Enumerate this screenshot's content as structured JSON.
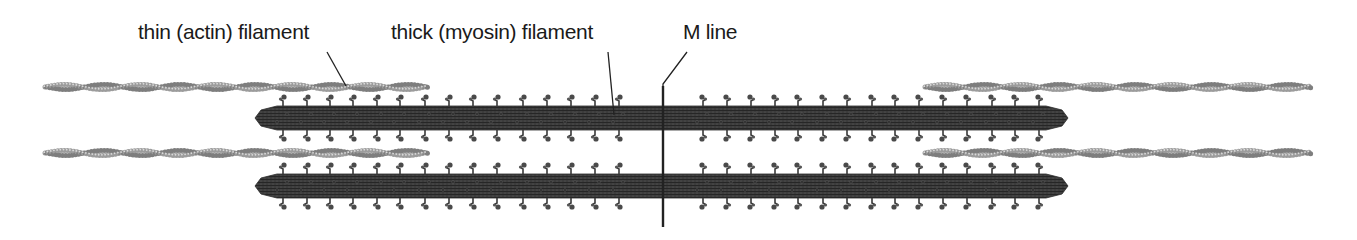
{
  "diagram": {
    "labels": {
      "thin": "thin (actin) filament",
      "thick": "thick (myosin) filament",
      "mline": "M line"
    },
    "colors": {
      "text": "#1a1a1a",
      "thick_filament": "#3a3a3a",
      "thick_filament_dark": "#262626",
      "myosin_head": "#4a4a4a",
      "thin_filament": "#9a9a9a",
      "thin_filament_light": "#c8c8c8",
      "m_line": "#222222",
      "leader_line": "#222222"
    },
    "thin_filaments": [
      {
        "side": "left",
        "row": "top",
        "x1": 45,
        "x2": 428,
        "y": 87
      },
      {
        "side": "left",
        "row": "bottom",
        "x1": 45,
        "x2": 428,
        "y": 153
      },
      {
        "side": "right",
        "row": "top",
        "x1": 925,
        "x2": 1309,
        "y": 87
      },
      {
        "side": "right",
        "row": "bottom",
        "x1": 925,
        "x2": 1309,
        "y": 153
      }
    ],
    "thick_filaments": [
      {
        "row": "top",
        "x1": 255,
        "x2": 1068,
        "y_top": 106,
        "y_bottom": 130
      },
      {
        "row": "bottom",
        "x1": 255,
        "x2": 1068,
        "y_top": 174,
        "y_bottom": 198
      }
    ],
    "myosin_heads_x": {
      "left": [
        283,
        307,
        330,
        353,
        377,
        400,
        425,
        449,
        473,
        497,
        523,
        547,
        571,
        595,
        619
      ],
      "right": [
        703,
        727,
        751,
        775,
        798,
        823,
        847,
        872,
        895,
        919,
        943,
        967,
        992,
        1015,
        1039
      ]
    },
    "m_line": {
      "x": 663,
      "y1": 86,
      "y2": 227
    }
  }
}
